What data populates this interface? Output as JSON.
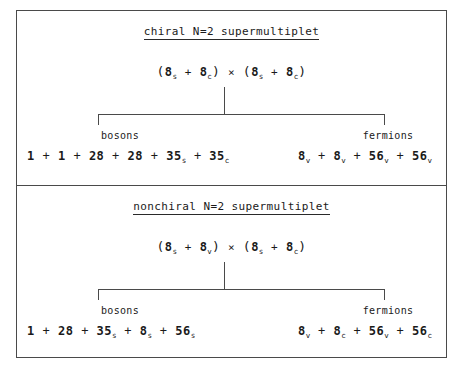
{
  "figure": {
    "panels": [
      {
        "id": "chiral",
        "title": "chiral N=2 supermultiplet",
        "product_formula": {
          "left_group": [
            {
              "dim": "8",
              "sub": "s"
            },
            {
              "dim": "8",
              "sub": "c"
            }
          ],
          "operator": "×",
          "right_group": [
            {
              "dim": "8",
              "sub": "s"
            },
            {
              "dim": "8",
              "sub": "c"
            }
          ],
          "plain_text": "(8s + 8c) × (8s + 8c)"
        },
        "branches": [
          {
            "id": "bosons",
            "label": "bosons",
            "terms": [
              {
                "dim": "1",
                "sub": ""
              },
              {
                "dim": "1",
                "sub": ""
              },
              {
                "dim": "28",
                "sub": ""
              },
              {
                "dim": "28",
                "sub": ""
              },
              {
                "dim": "35",
                "sub": "s"
              },
              {
                "dim": "35",
                "sub": "c"
              }
            ],
            "plain_text": "1 + 1 + 28 + 28 + 35s + 35c"
          },
          {
            "id": "fermions",
            "label": "fermions",
            "terms": [
              {
                "dim": "8",
                "sub": "v"
              },
              {
                "dim": "8",
                "sub": "v"
              },
              {
                "dim": "56",
                "sub": "v"
              },
              {
                "dim": "56",
                "sub": "v"
              }
            ],
            "plain_text": "8v + 8v + 56v + 56v"
          }
        ]
      },
      {
        "id": "nonchiral",
        "title": "nonchiral N=2 supermultiplet",
        "product_formula": {
          "left_group": [
            {
              "dim": "8",
              "sub": "s"
            },
            {
              "dim": "8",
              "sub": "v"
            }
          ],
          "operator": "×",
          "right_group": [
            {
              "dim": "8",
              "sub": "s"
            },
            {
              "dim": "8",
              "sub": "c"
            }
          ],
          "plain_text": "(8s + 8v) × (8s + 8c)"
        },
        "branches": [
          {
            "id": "bosons",
            "label": "bosons",
            "terms": [
              {
                "dim": "1",
                "sub": ""
              },
              {
                "dim": "28",
                "sub": ""
              },
              {
                "dim": "35",
                "sub": "s"
              },
              {
                "dim": "8",
                "sub": "s"
              },
              {
                "dim": "56",
                "sub": "s"
              }
            ],
            "plain_text": "1 + 28 + 35s + 8s + 56s"
          },
          {
            "id": "fermions",
            "label": "fermions",
            "terms": [
              {
                "dim": "8",
                "sub": "v"
              },
              {
                "dim": "8",
                "sub": "c"
              },
              {
                "dim": "56",
                "sub": "v"
              },
              {
                "dim": "56",
                "sub": "c"
              }
            ],
            "plain_text": "8v + 8c + 56v + 56c"
          }
        ]
      }
    ],
    "symbols": {
      "plus": "+",
      "times": "×",
      "paren_open": "(",
      "paren_close": ")"
    },
    "colors": {
      "ink": "#1a1a1a",
      "rule": "#4a4a4a",
      "background": "#ffffff"
    }
  }
}
